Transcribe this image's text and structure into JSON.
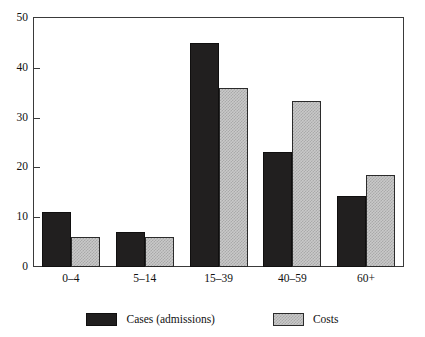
{
  "chart_data": {
    "type": "bar",
    "title": "",
    "subtitle": "",
    "xlabel": "",
    "ylabel": "",
    "categories": [
      "0–4",
      "5–14",
      "15–39",
      "40–59",
      "60+"
    ],
    "series": [
      {
        "name": "Cases (admissions)",
        "color": "#211f1f",
        "fill": "solid-black",
        "values": [
          11,
          7,
          45,
          23,
          14.2
        ]
      },
      {
        "name": "Costs",
        "color": "#c9c9c9",
        "fill": "gray-checkered",
        "values": [
          6,
          6,
          36,
          33.4,
          18.4
        ]
      }
    ],
    "ylim": [
      0,
      50
    ],
    "y_ticks": [
      0,
      10,
      20,
      30,
      40,
      50
    ],
    "y_tick_labels": [
      "0",
      "10",
      "20",
      "30",
      "40",
      "50"
    ],
    "grid": false,
    "legend_position": "bottom-center",
    "frame": true
  },
  "legend": {
    "items": [
      {
        "label": "Cases (admissions)",
        "swatch": "cases"
      },
      {
        "label": "Costs",
        "swatch": "costs"
      }
    ]
  }
}
